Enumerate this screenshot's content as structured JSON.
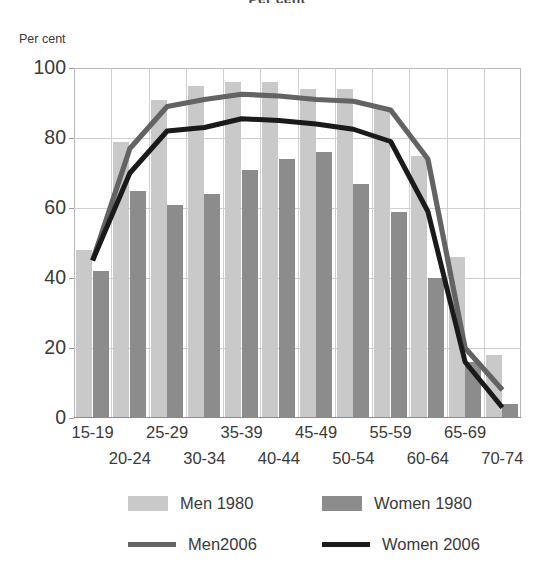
{
  "figure": {
    "title": "Per cent",
    "y_axis_unit": "Per cent"
  },
  "axes": {
    "y_ticks": [
      "0",
      "20",
      "40",
      "60",
      "80",
      "100"
    ],
    "x_ticks_row_a": [
      "15-19",
      "25-29",
      "35-39",
      "45-49",
      "55-59",
      "65-69"
    ],
    "x_ticks_row_b": [
      "20-24",
      "30-34",
      "40-44",
      "50-54",
      "60-64",
      "70-74"
    ]
  },
  "legend": {
    "entries": [
      {
        "label": "Men 1980",
        "marker": "box",
        "color": "#c9c9c9"
      },
      {
        "label": "Women 1980",
        "marker": "box",
        "color": "#8c8c8c"
      },
      {
        "label": "Men2006",
        "marker": "line",
        "color": "#636363"
      },
      {
        "label": "Women 2006",
        "marker": "line",
        "color": "#1a1a1a"
      }
    ]
  },
  "colors": {
    "men_1980": "#c9c9c9",
    "women_1980": "#8c8c8c",
    "men_2006": "#636363",
    "women_2006": "#1a1a1a",
    "gridline": "#cfcfcf",
    "frame": "#b9b9b9"
  },
  "chart_data": {
    "type": "bar",
    "title": "Per cent",
    "xlabel": "",
    "ylabel": "Per cent",
    "ylim": [
      0,
      100
    ],
    "ytick_step": 20,
    "grid": true,
    "legend_position": "bottom",
    "categories": [
      "15-19",
      "20-24",
      "25-29",
      "30-34",
      "35-39",
      "40-44",
      "45-49",
      "50-54",
      "55-59",
      "60-64",
      "65-69",
      "70-74"
    ],
    "series": [
      {
        "name": "Men 1980",
        "type": "bar",
        "color": "#c9c9c9",
        "values": [
          48,
          79,
          91,
          95,
          96,
          96,
          94,
          94,
          89,
          75,
          46,
          18
        ]
      },
      {
        "name": "Women 1980",
        "type": "bar",
        "color": "#8c8c8c",
        "values": [
          42,
          65,
          61,
          64,
          71,
          74,
          76,
          67,
          59,
          40,
          16,
          4
        ]
      },
      {
        "name": "Men2006",
        "type": "line",
        "color": "#636363",
        "values": [
          45,
          77,
          89,
          91,
          92.5,
          92,
          91,
          90.5,
          88,
          74,
          20,
          8
        ]
      },
      {
        "name": "Women 2006",
        "type": "line",
        "color": "#1a1a1a",
        "values": [
          45,
          70,
          82,
          83,
          85.5,
          85,
          84,
          82.5,
          79,
          59,
          16,
          3
        ]
      }
    ]
  }
}
